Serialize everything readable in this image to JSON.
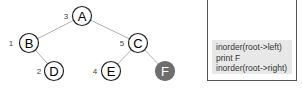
{
  "tree": {
    "nodes": [
      {
        "id": "A",
        "label": "A",
        "order": "3",
        "x": 82,
        "y": 16,
        "filled": false
      },
      {
        "id": "B",
        "label": "B",
        "order": "1",
        "x": 29,
        "y": 43,
        "filled": false
      },
      {
        "id": "C",
        "label": "C",
        "order": "5",
        "x": 138,
        "y": 43,
        "filled": false
      },
      {
        "id": "D",
        "label": "D",
        "order": "2",
        "x": 54,
        "y": 71,
        "filled": false
      },
      {
        "id": "E",
        "label": "E",
        "order": "4",
        "x": 111,
        "y": 71,
        "filled": false
      },
      {
        "id": "F",
        "label": "F",
        "order": "",
        "x": 165,
        "y": 71,
        "filled": true
      }
    ],
    "edges": [
      [
        "A",
        "B"
      ],
      [
        "A",
        "C"
      ],
      [
        "B",
        "D"
      ],
      [
        "C",
        "E"
      ],
      [
        "C",
        "F"
      ]
    ],
    "colors": {
      "edge": "#b0b0b0",
      "node_stroke": "#222222",
      "filled_node": "#6e6e6e"
    }
  },
  "stack": {
    "frame_lines": [
      "inorder(root->left)",
      "print F",
      "inorder(root->right)"
    ]
  }
}
